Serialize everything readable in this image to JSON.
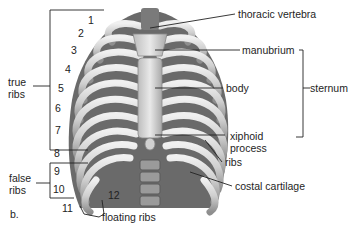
{
  "figure": {
    "panel_label": "b.",
    "rib_numbers": [
      "1",
      "2",
      "3",
      "4",
      "5",
      "6",
      "7",
      "8",
      "9",
      "10",
      "11",
      "12"
    ],
    "left_groups": {
      "true_ribs": "true\nribs",
      "true_ribs_line1": "true",
      "true_ribs_line2": "ribs",
      "false_ribs_line1": "false",
      "false_ribs_line2": "ribs",
      "floating_ribs": "floating ribs"
    },
    "right_labels": {
      "thoracic_vertebra": "thoracic vertebra",
      "manubrium": "manubrium",
      "body": "body",
      "sternum": "sternum",
      "xiphoid_line1": "xiphoid",
      "xiphoid_line2": "process",
      "ribs": "ribs",
      "costal_cartilage": "costal cartilage"
    },
    "colors": {
      "bone": "#d8d8d8",
      "bone_shadow": "#8a8a8a",
      "interior": "#5c5c5c",
      "leader_line": "#222222"
    }
  }
}
